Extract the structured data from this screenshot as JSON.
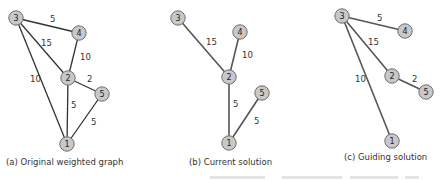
{
  "colors": {
    "node_fill": "#c8c8c8",
    "node_stroke": "#6e6e6e",
    "edge_a": "#333333",
    "edge_bc": "#555555",
    "label": "#333333"
  },
  "panels": [
    {
      "id": "a",
      "caption": "(a) Original weighted graph",
      "caption_pos": [
        6,
        160
      ],
      "nodes": [
        {
          "id": "1",
          "x": 67,
          "y": 144
        },
        {
          "id": "2",
          "x": 68,
          "y": 78
        },
        {
          "id": "3",
          "x": 16,
          "y": 18
        },
        {
          "id": "4",
          "x": 79,
          "y": 33
        },
        {
          "id": "5",
          "x": 102,
          "y": 94
        }
      ],
      "edges": [
        {
          "from": "3",
          "to": "4",
          "weight": "5",
          "lx": 50,
          "ly": 22
        },
        {
          "from": "3",
          "to": "2",
          "weight": "15",
          "lx": 41,
          "ly": 46
        },
        {
          "from": "3",
          "to": "1",
          "weight": "10",
          "lx": 30,
          "ly": 82
        },
        {
          "from": "4",
          "to": "2",
          "weight": "10",
          "lx": 80,
          "ly": 60
        },
        {
          "from": "2",
          "to": "5",
          "weight": "2",
          "lx": 87,
          "ly": 82
        },
        {
          "from": "2",
          "to": "1",
          "weight": "5",
          "lx": 71,
          "ly": 108
        },
        {
          "from": "5",
          "to": "1",
          "weight": "5",
          "lx": 91,
          "ly": 125
        }
      ]
    },
    {
      "id": "b",
      "caption": "(b) Current solution",
      "caption_pos": [
        189,
        160
      ],
      "nodes": [
        {
          "id": "1",
          "x": 229,
          "y": 143
        },
        {
          "id": "2",
          "x": 229,
          "y": 77
        },
        {
          "id": "3",
          "x": 178,
          "y": 18
        },
        {
          "id": "4",
          "x": 240,
          "y": 32
        },
        {
          "id": "5",
          "x": 262,
          "y": 93
        }
      ],
      "edges": [
        {
          "from": "3",
          "to": "2",
          "weight": "15",
          "lx": 206,
          "ly": 45
        },
        {
          "from": "4",
          "to": "2",
          "weight": "10",
          "lx": 242,
          "ly": 58
        },
        {
          "from": "2",
          "to": "1",
          "weight": "5",
          "lx": 233,
          "ly": 107
        },
        {
          "from": "5",
          "to": "1",
          "weight": "5",
          "lx": 254,
          "ly": 124
        }
      ]
    },
    {
      "id": "c",
      "caption": "(c) Guiding solution",
      "caption_pos": [
        344,
        155
      ],
      "nodes": [
        {
          "id": "1",
          "x": 392,
          "y": 141
        },
        {
          "id": "2",
          "x": 392,
          "y": 76
        },
        {
          "id": "3",
          "x": 342,
          "y": 16
        },
        {
          "id": "4",
          "x": 405,
          "y": 31
        },
        {
          "id": "5",
          "x": 426,
          "y": 92
        }
      ],
      "edges": [
        {
          "from": "3",
          "to": "4",
          "weight": "5",
          "lx": 377,
          "ly": 21
        },
        {
          "from": "3",
          "to": "2",
          "weight": "15",
          "lx": 368,
          "ly": 45
        },
        {
          "from": "3",
          "to": "1",
          "weight": "10",
          "lx": 355,
          "ly": 82
        },
        {
          "from": "2",
          "to": "5",
          "weight": "2",
          "lx": 412,
          "ly": 82
        }
      ]
    }
  ]
}
